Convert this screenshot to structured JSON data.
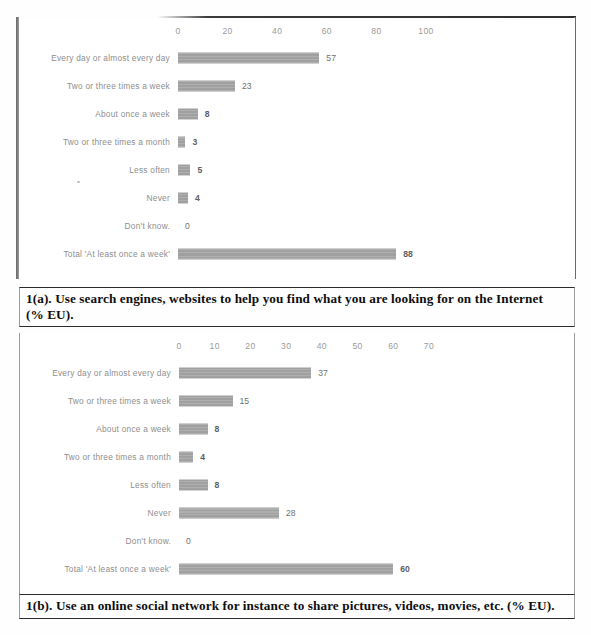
{
  "document": {
    "kind": "scanned-report-page",
    "bar_color": "#a0a0a0",
    "axis_label_color": "#9a9a9a",
    "caption_color": "#0e0e0e"
  },
  "chart_data": [
    {
      "id": "chart-1a",
      "type": "bar",
      "orientation": "horizontal",
      "title": "1(a). Use search engines, websites to help you find what you are looking for on the Internet (% EU).",
      "xlabel": "",
      "ylabel": "",
      "xlim": [
        0,
        100
      ],
      "ticks": [
        "0",
        "20",
        "40",
        "60",
        "80",
        "100"
      ],
      "tick_values": [
        0,
        20,
        40,
        60,
        80,
        100
      ],
      "grid": false,
      "legend": false,
      "categories": [
        "Every day or almost every day",
        "Two or three times a week",
        "About once a week",
        "Two or three times a month",
        "Less often",
        "Never",
        "Don't know.",
        "Total 'At least once a week'"
      ],
      "values": [
        57,
        23,
        8,
        3,
        5,
        4,
        0,
        88
      ],
      "value_labels": [
        "57",
        "23",
        "8",
        "3",
        "5",
        "4",
        "0",
        "88"
      ]
    },
    {
      "id": "chart-1b",
      "type": "bar",
      "orientation": "horizontal",
      "title": "1(b). Use an online social network for instance to share pictures, videos, movies, etc. (% EU).",
      "xlabel": "",
      "ylabel": "",
      "xlim": [
        0,
        70
      ],
      "ticks": [
        "0",
        "10",
        "20",
        "30",
        "40",
        "50",
        "60",
        "70"
      ],
      "tick_values": [
        0,
        10,
        20,
        30,
        40,
        50,
        60,
        70
      ],
      "grid": false,
      "legend": false,
      "categories": [
        "Every day or almost every day",
        "Two or three times a week",
        "About once a week",
        "Two or three times a month",
        "Less often",
        "Never",
        "Don't know.",
        "Total 'At least once a week'"
      ],
      "values": [
        37,
        15,
        8,
        4,
        8,
        28,
        0,
        60
      ],
      "value_labels": [
        "37",
        "15",
        "8",
        "4",
        "8",
        "28",
        "0",
        "60"
      ]
    }
  ],
  "captions": {
    "a_line1": "1(a). Use search engines, websites to help you find what you are looking for on the Internet",
    "a_line2": "(% EU).",
    "b_line1": "1(b). Use an online social network for instance to share pictures, videos, movies, etc. (% EU)."
  }
}
